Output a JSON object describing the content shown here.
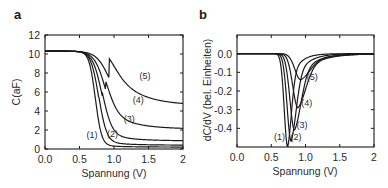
{
  "chart_data": [
    {
      "panel": "a",
      "type": "line",
      "title": "",
      "xlabel": "Spannung (V)",
      "ylabel": "C(aF)",
      "xlim": [
        0,
        2
      ],
      "ylim": [
        0,
        12
      ],
      "xticks": [
        "0.0",
        "0.5",
        "1.0",
        "1.5",
        "2"
      ],
      "yticks": [
        "0",
        "2",
        "4",
        "6",
        "8",
        "10",
        "12"
      ],
      "grid": false,
      "legend": "inline curve labels",
      "series": [
        {
          "name": "(1)",
          "plateau": 10.3,
          "midpoint_V": 0.73,
          "final_at_2V": 0.2,
          "label_pos": [
            0.68,
            1.2
          ]
        },
        {
          "name": "(2)",
          "plateau": 10.3,
          "midpoint_V": 0.78,
          "final_at_2V": 0.4,
          "label_pos": [
            0.98,
            1.3
          ]
        },
        {
          "name": "(3)",
          "plateau": 10.3,
          "midpoint_V": 0.83,
          "final_at_2V": 0.85,
          "label_pos": [
            1.22,
            2.8
          ]
        },
        {
          "name": "(4)",
          "plateau": 10.3,
          "midpoint_V": 0.88,
          "final_at_2V": 2.1,
          "label_pos": [
            1.35,
            4.8
          ]
        },
        {
          "name": "(5)",
          "plateau": 10.3,
          "midpoint_V": 0.93,
          "final_at_2V": 4.6,
          "label_pos": [
            1.45,
            7.4
          ]
        }
      ]
    },
    {
      "panel": "b",
      "type": "line",
      "title": "",
      "xlabel": "Spannung (V)",
      "ylabel": "dC/dV (bel. Einheiten)",
      "xlim": [
        0,
        2
      ],
      "ylim": [
        -0.5,
        0.1
      ],
      "xticks": [
        "0.0",
        "0.5",
        "1.0",
        "1.5",
        "2"
      ],
      "yticks": [
        "0.0",
        "-0.1",
        "-0.2",
        "-0.3",
        "-0.4"
      ],
      "grid": false,
      "legend": "inline curve labels",
      "series": [
        {
          "name": "(1)",
          "min_V": 0.74,
          "min_value": -0.5,
          "label_pos": [
            0.62,
            -0.46
          ]
        },
        {
          "name": "(2)",
          "min_V": 0.79,
          "min_value": -0.47,
          "label_pos": [
            0.86,
            -0.46
          ]
        },
        {
          "name": "(3)",
          "min_V": 0.84,
          "min_value": -0.41,
          "label_pos": [
            0.95,
            -0.4
          ]
        },
        {
          "name": "(4)",
          "min_V": 0.89,
          "min_value": -0.29,
          "label_pos": [
            1.02,
            -0.28
          ]
        },
        {
          "name": "(5)",
          "min_V": 0.93,
          "min_value": -0.14,
          "label_pos": [
            1.1,
            -0.14
          ]
        }
      ]
    }
  ],
  "panels": {
    "a": {
      "label": "a",
      "xlabel": "Spannung (V)",
      "ylabel": "C(aF)"
    },
    "b": {
      "label": "b",
      "xlabel": "Spannung (V)",
      "ylabel": "dC/dV (bel. Einheiten)"
    }
  },
  "colors": {
    "line": "#1a1a1a",
    "text": "#2a2a2a",
    "background": "#ffffff"
  }
}
